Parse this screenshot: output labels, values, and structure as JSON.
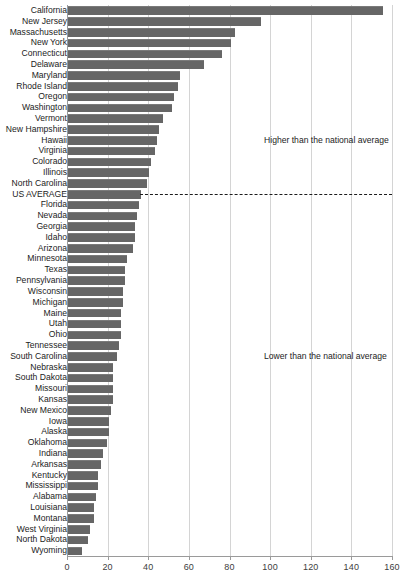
{
  "chart_data": {
    "type": "bar",
    "orientation": "horizontal",
    "title": "",
    "subtitle": "",
    "xlabel": "",
    "ylabel": "",
    "xlim": [
      0,
      160
    ],
    "xticks": [
      0,
      20,
      40,
      60,
      80,
      100,
      120,
      140,
      160
    ],
    "grid": true,
    "legend": null,
    "bar_color": "#666666",
    "categories": [
      "California",
      "New Jersey",
      "Massachusetts",
      "New York",
      "Connecticut",
      "Delaware",
      "Maryland",
      "Rhode Island",
      "Oregon",
      "Washington",
      "Vermont",
      "New Hampshire",
      "Hawaii",
      "Virginia",
      "Colorado",
      "Illinois",
      "North Carolina",
      "US AVERAGE",
      "Florida",
      "Nevada",
      "Georgia",
      "Idaho",
      "Arizona",
      "Minnesota",
      "Texas",
      "Pennsylvania",
      "Wisconsin",
      "Michigan",
      "Maine",
      "Utah",
      "Ohio",
      "Tennessee",
      "South Carolina",
      "Nebraska",
      "South Dakota",
      "Missouri",
      "Kansas",
      "New Mexico",
      "Iowa",
      "Alaska",
      "Oklahoma",
      "Indiana",
      "Arkansas",
      "Kentucky",
      "Mississippi",
      "Alabama",
      "Louisiana",
      "Montana",
      "West Virginia",
      "North Dakota",
      "Wyoming"
    ],
    "values": [
      155,
      95,
      82,
      80,
      76,
      67,
      55,
      54,
      52,
      51,
      47,
      45,
      44,
      43,
      41,
      40,
      39,
      36,
      35,
      34,
      33,
      33,
      32,
      29,
      28,
      28,
      27,
      27,
      26,
      26,
      26,
      25,
      24,
      22,
      22,
      22,
      22,
      21,
      20,
      20,
      19,
      17,
      16,
      15,
      15,
      14,
      13,
      13,
      11,
      10,
      7
    ],
    "reference_line": {
      "label": "US AVERAGE",
      "value": 36,
      "style": "dashed"
    },
    "annotations": [
      {
        "text": "Higher than the national average",
        "x": 97,
        "row": 12
      },
      {
        "text": "Lower than the national average",
        "x": 97,
        "row": 32
      }
    ]
  },
  "axis": {
    "tick_labels": [
      "0",
      "20",
      "40",
      "60",
      "80",
      "100",
      "120",
      "140",
      "160"
    ]
  },
  "notes": {
    "higher_label": "Higher than the national average",
    "lower_label": "Lower than the national average"
  }
}
